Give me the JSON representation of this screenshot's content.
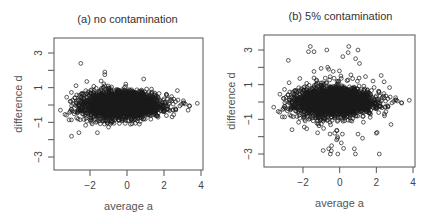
{
  "chart_data": [
    {
      "type": "scatter",
      "title": "(a) no contamination",
      "xlabel": "average a",
      "ylabel": "difference d",
      "xlim": [
        -3.9,
        4.1
      ],
      "ylim": [
        -3.5,
        3.6
      ],
      "x_ticks": [
        -2,
        0,
        2,
        4
      ],
      "x_tick_labels": [
        "−2",
        "0",
        "2",
        "4"
      ],
      "y_ticks": [
        -3,
        -1,
        1,
        3
      ],
      "y_tick_labels": [
        "−3",
        "−1",
        "1",
        "3"
      ],
      "y_minor_ticks": [
        -3,
        -2,
        -1,
        0,
        1,
        2,
        3
      ],
      "grid": false,
      "legend": null,
      "marker": "open-circle",
      "description": "Dense MA-plot cloud; d centered at 0 with spread ~±1.2, narrowing as a increases; a ranges about -3.6 to 3.8.",
      "cloud": {
        "n": 2600,
        "a_mean": -0.3,
        "a_sd": 1.05,
        "d_sd_base": 0.42,
        "seed": 11
      },
      "contamination_fraction": 0,
      "notable_points": [
        {
          "a": -2.5,
          "d": 2.4
        },
        {
          "a": -1.2,
          "d": 1.9
        },
        {
          "a": -1.2,
          "d": 1.75
        },
        {
          "a": 0.9,
          "d": 1.5
        },
        {
          "a": -3.6,
          "d": -0.3
        },
        {
          "a": 3.8,
          "d": 0.1
        },
        {
          "a": -3.0,
          "d": -1.8
        },
        {
          "a": -2.6,
          "d": -1.6
        },
        {
          "a": -1.6,
          "d": -1.6
        },
        {
          "a": 3.3,
          "d": -0.3
        }
      ]
    },
    {
      "type": "scatter",
      "title": "(b) 5% contamination",
      "xlabel": "average a",
      "ylabel": "difference d",
      "xlim": [
        -3.9,
        4.1
      ],
      "ylim": [
        -3.5,
        3.6
      ],
      "x_ticks": [
        -2,
        0,
        2,
        4
      ],
      "x_tick_labels": [
        "−2",
        "0",
        "2",
        "4"
      ],
      "y_ticks": [
        -3,
        -1,
        1,
        3
      ],
      "y_tick_labels": [
        "−3",
        "−1",
        "1",
        "3"
      ],
      "y_minor_ticks": [
        -3,
        -2,
        -1,
        0,
        1,
        2,
        3
      ],
      "grid": false,
      "legend": null,
      "marker": "open-circle",
      "description": "Same cloud as (a) plus ~5% contaminated points with inflated |d| reaching about ±3, concentrated for a between -2 and 2.",
      "cloud": {
        "n": 2600,
        "a_mean": -0.3,
        "a_sd": 1.05,
        "d_sd_base": 0.42,
        "seed": 11
      },
      "contamination_fraction": 0.05,
      "contamination": {
        "n": 140,
        "a_mean": -0.2,
        "a_sd": 1.0,
        "d_sd": 1.35,
        "seed": 29
      },
      "notable_points": [
        {
          "a": -1.6,
          "d": 3.2
        },
        {
          "a": -1.7,
          "d": 2.9
        },
        {
          "a": -1.4,
          "d": 2.9
        },
        {
          "a": -0.7,
          "d": 3.0
        },
        {
          "a": 1.0,
          "d": 3.0
        },
        {
          "a": -2.8,
          "d": 2.4
        },
        {
          "a": -0.9,
          "d": -2.8
        },
        {
          "a": -0.6,
          "d": -2.7
        },
        {
          "a": -0.1,
          "d": -3.0
        },
        {
          "a": 0.8,
          "d": -2.7
        },
        {
          "a": -3.6,
          "d": -0.3
        },
        {
          "a": 3.8,
          "d": 0.1
        },
        {
          "a": 2.8,
          "d": -1.3
        },
        {
          "a": -2.6,
          "d": -1.6
        },
        {
          "a": 2.0,
          "d": -1.8
        }
      ]
    }
  ]
}
